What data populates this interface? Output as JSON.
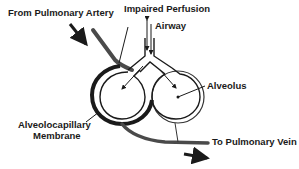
{
  "diagram": {
    "title": "Impaired Perfusion",
    "labels": {
      "from_artery": "From Pulmonary Artery",
      "impaired_perfusion": "Impaired Perfusion",
      "airway": "Airway",
      "alveolus": "Alveolus",
      "membrane_line1": "Alveolocapillary",
      "membrane_line2": "Membrane",
      "to_vein": "To Pulmonary Vein"
    },
    "colors": {
      "stroke": "#1a1a1a",
      "vessel": "#4a4a4a",
      "background": "#ffffff"
    }
  }
}
